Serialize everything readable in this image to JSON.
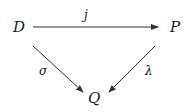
{
  "diagram": {
    "type": "commutative-triangle",
    "nodes": {
      "source": "D",
      "target": "P",
      "bottom": "Q"
    },
    "arrows": [
      {
        "from": "D",
        "to": "P",
        "label": "j"
      },
      {
        "from": "D",
        "to": "Q",
        "label": "σ"
      },
      {
        "from": "P",
        "to": "Q",
        "label": "λ"
      }
    ]
  }
}
